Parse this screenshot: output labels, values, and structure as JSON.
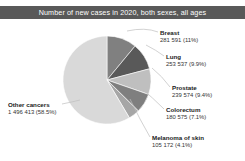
{
  "title": "Number of new cases in 2020, both sexes, all ages",
  "colors": {
    "title_bar": "#595959",
    "title_text": "#ffffff",
    "background": "#ffffff",
    "other": "#d9d9d9",
    "breast": "#808080",
    "lung": "#595959",
    "prostate": "#bfbfbf",
    "colorectum": "#7f7f7f",
    "melanoma": "#a6a6a6",
    "leader_line": "#bfbfbf"
  },
  "chart_data": {
    "type": "pie",
    "title": "Number of new cases in 2020, both sexes, all ages",
    "xlabel": "",
    "ylabel": "",
    "legend": "none",
    "labels": [
      "Breast",
      "Lung",
      "Prostate",
      "Colorectum",
      "Melanoma of skin",
      "Other cancers"
    ],
    "values": [
      281591,
      253537,
      239574,
      180575,
      105172,
      1496413
    ],
    "percents": [
      11.0,
      9.9,
      9.4,
      7.1,
      4.1,
      58.5
    ],
    "value_labels": [
      "281 591 (11%)",
      "253 537 (9.9%)",
      "239 574 (9.4%)",
      "180 575 (7.1%)",
      "105 172 (4.1%)",
      "1 496 413 (58.5%)"
    ],
    "total": 2556862
  },
  "slices": {
    "breast": {
      "name": "Breast",
      "value": "281 591 (11%)"
    },
    "lung": {
      "name": "Lung",
      "value": "253 537 (9.9%)"
    },
    "prostate": {
      "name": "Prostate",
      "value": "239 574 (9.4%)"
    },
    "colorectum": {
      "name": "Colorectum",
      "value": "180 575 (7.1%)"
    },
    "melanoma": {
      "name": "Melanoma of skin",
      "value": "105 172 (4.1%)"
    },
    "other": {
      "name": "Other cancers",
      "value": "1 496 413 (58.5%)"
    }
  }
}
